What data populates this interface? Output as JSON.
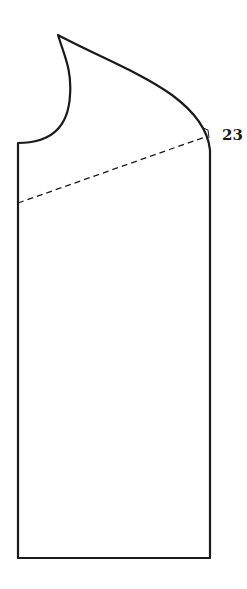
{
  "diagram": {
    "type": "sewing-pattern-piece",
    "stroke_color": "#1a1a1a",
    "background_color": "#ffffff",
    "annotations": [
      {
        "text": "23",
        "x": 222,
        "y": 128
      }
    ],
    "outline": {
      "peak": [
        58,
        35
      ],
      "left_shoulder": [
        18,
        143
      ],
      "right_top": [
        210,
        148
      ],
      "bottom_left": [
        18,
        558
      ],
      "bottom_right": [
        210,
        558
      ]
    },
    "dashed_line": {
      "from": [
        18,
        203
      ],
      "to": [
        205,
        137
      ]
    }
  }
}
